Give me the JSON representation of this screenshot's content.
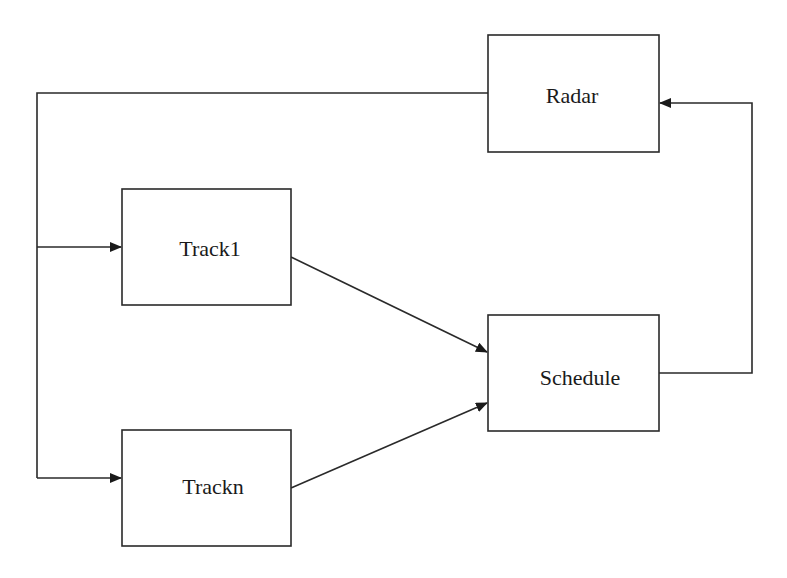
{
  "diagram": {
    "type": "block-flow",
    "background": "#ffffff",
    "line_color": "#2a2a2a",
    "nodes": [
      {
        "id": "radar",
        "label": "Radar",
        "x": 488,
        "y": 35,
        "w": 171,
        "h": 117
      },
      {
        "id": "track1",
        "label": "Track1",
        "x": 122,
        "y": 189,
        "w": 169,
        "h": 116
      },
      {
        "id": "trackn",
        "label": "Trackn",
        "x": 122,
        "y": 430,
        "w": 169,
        "h": 116
      },
      {
        "id": "schedule",
        "label": "Schedule",
        "x": 488,
        "y": 315,
        "w": 171,
        "h": 116
      }
    ],
    "edges": [
      {
        "from": "radar",
        "to": "track1",
        "route": "Radar left edge -> left bus -> Track1"
      },
      {
        "from": "radar",
        "to": "trackn",
        "route": "Radar left edge -> left bus -> Trackn"
      },
      {
        "from": "track1",
        "to": "schedule",
        "route": "direct diagonal"
      },
      {
        "from": "trackn",
        "to": "schedule",
        "route": "direct diagonal"
      },
      {
        "from": "schedule",
        "to": "radar",
        "route": "Schedule right -> up -> Radar right"
      }
    ]
  }
}
